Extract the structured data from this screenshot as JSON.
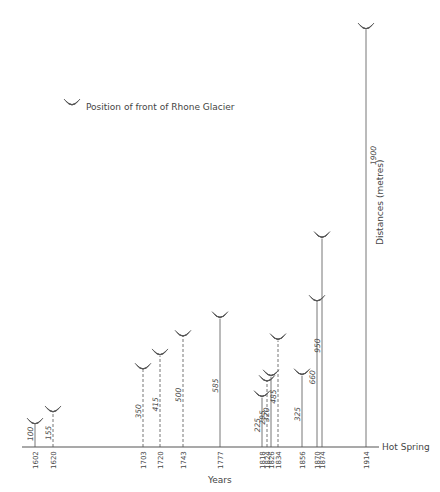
{
  "chart_data": {
    "type": "bar",
    "title": "Position of front of Rhone Glacier",
    "xlabel": "Years",
    "ylabel": "Distances (metres)",
    "baseline_label": "Hot Spring",
    "legend": {
      "label": "Position of front of Rhone Glacier",
      "symbol": "glacier-front-icon",
      "position": "upper-left"
    },
    "categories": [
      "1602",
      "1620",
      "1703",
      "1720",
      "1743",
      "1777",
      "1818",
      "1824",
      "1826",
      "1834",
      "1856",
      "1870",
      "1874",
      "1914"
    ],
    "values": [
      100,
      155,
      350,
      415,
      500,
      585,
      225,
      295,
      320,
      485,
      325,
      660,
      950,
      1900
    ],
    "line_style": [
      "solid",
      "dashed",
      "dashed",
      "dashed",
      "dashed",
      "solid",
      "solid",
      "dashed",
      "solid",
      "dashed",
      "solid",
      "solid",
      "solid",
      "solid"
    ],
    "ylim": [
      0,
      1900
    ],
    "grid": false
  },
  "colors": {
    "ink": "#555555",
    "background": "#ffffff"
  }
}
